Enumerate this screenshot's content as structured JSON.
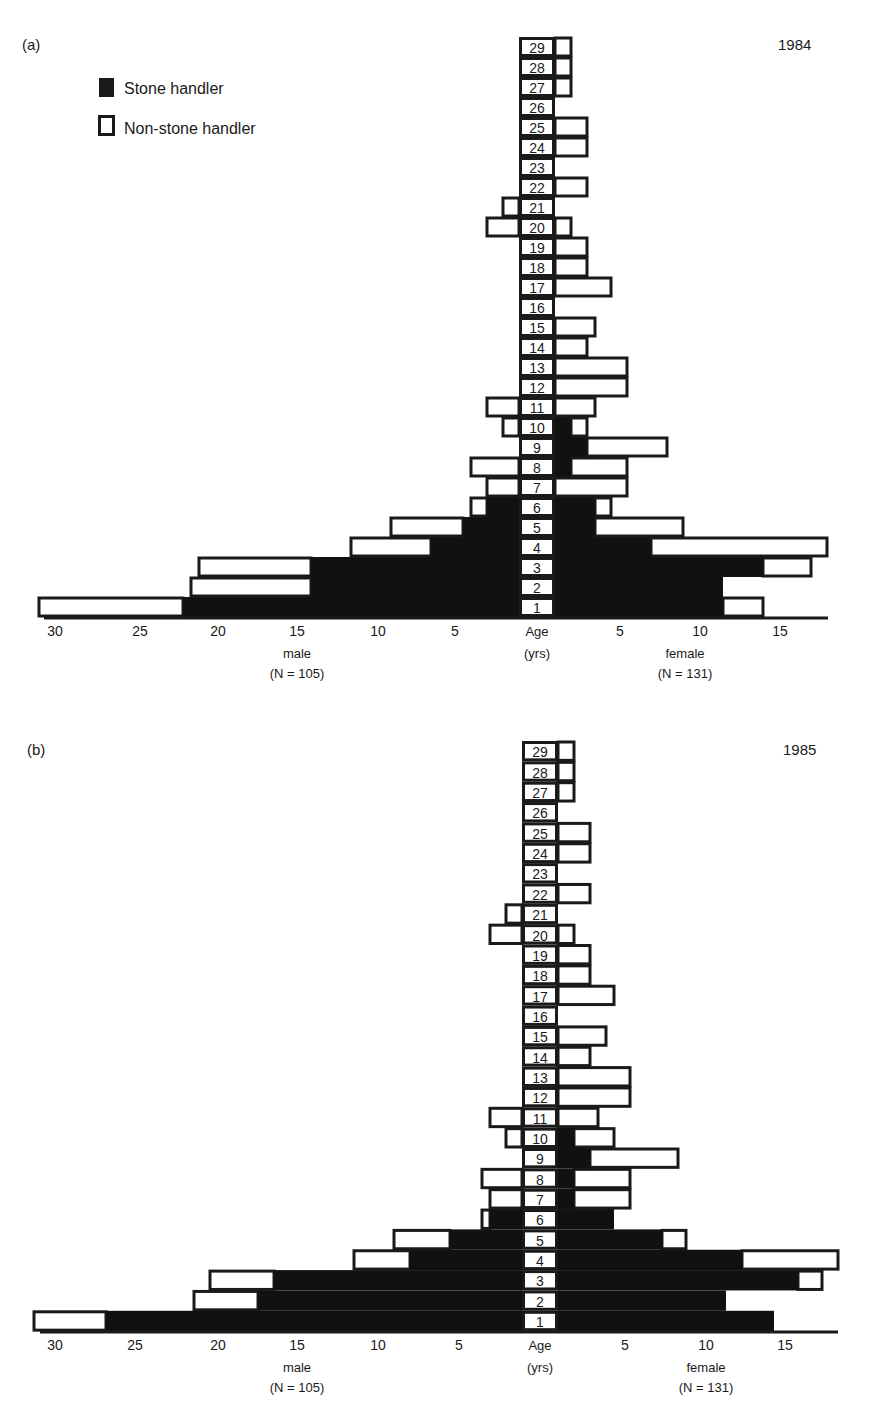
{
  "legend": {
    "stone_label": "Stone handler",
    "non_stone_label": "Non-stone handler"
  },
  "colors": {
    "stone": "#111111",
    "non_stone": "#ffffff",
    "stroke": "#1a1a1a"
  },
  "chart_data": [
    {
      "type": "bar",
      "subtype": "population-pyramid (stacked horizontal)",
      "panel": "(a)",
      "title": "1984",
      "ylabel": "Age (yrs)",
      "left_label": "male",
      "left_n": "(N = 105)",
      "right_label": "female",
      "right_n": "(N = 131)",
      "left_ticks": [
        30,
        25,
        20,
        15,
        10,
        5
      ],
      "right_ticks": [
        5,
        10,
        15
      ],
      "categories": [
        1,
        2,
        3,
        4,
        5,
        6,
        7,
        8,
        9,
        10,
        11,
        12,
        13,
        14,
        15,
        16,
        17,
        18,
        19,
        20,
        21,
        22,
        23,
        24,
        25,
        26,
        27,
        28,
        29
      ],
      "series": [
        {
          "name": "male stone handler",
          "values": [
            21,
            13,
            13,
            5.5,
            3.5,
            2,
            0,
            0,
            0,
            0,
            0,
            0,
            0,
            0,
            0,
            0,
            0,
            0,
            0,
            0,
            0,
            0,
            0,
            0,
            0,
            0,
            0,
            0,
            0
          ]
        },
        {
          "name": "male non-stone handler",
          "values": [
            9,
            7.5,
            7,
            5,
            4.5,
            1,
            2,
            3,
            0,
            1,
            2,
            0,
            0,
            0,
            0,
            0,
            0,
            0,
            0,
            2,
            1,
            0,
            0,
            0,
            0,
            0,
            0,
            0,
            0
          ]
        },
        {
          "name": "female stone handler",
          "values": [
            10.5,
            10.5,
            13,
            6,
            2.5,
            2.5,
            0,
            1,
            2,
            1,
            0,
            0,
            0,
            0,
            0,
            0,
            0,
            0,
            0,
            0,
            0,
            0,
            0,
            0,
            0,
            0,
            0,
            0,
            0
          ]
        },
        {
          "name": "female non-stone handler",
          "values": [
            2.5,
            0,
            3,
            11,
            5.5,
            1,
            4.5,
            3.5,
            5,
            1,
            2.5,
            4.5,
            4.5,
            2,
            2.5,
            0,
            3.5,
            2,
            2,
            1,
            0,
            2,
            0,
            2,
            2,
            0,
            1,
            1,
            1
          ]
        }
      ]
    },
    {
      "type": "bar",
      "subtype": "population-pyramid (stacked horizontal)",
      "panel": "(b)",
      "title": "1985",
      "ylabel": "Age (yrs)",
      "left_label": "male",
      "left_n": "(N = 105)",
      "right_label": "female",
      "right_n": "(N = 131)",
      "left_ticks": [
        30,
        25,
        20,
        15,
        10,
        5
      ],
      "right_ticks": [
        5,
        10,
        15
      ],
      "categories": [
        1,
        2,
        3,
        4,
        5,
        6,
        7,
        8,
        9,
        10,
        11,
        12,
        13,
        14,
        15,
        16,
        17,
        18,
        19,
        20,
        21,
        22,
        23,
        24,
        25,
        26,
        27,
        28,
        29
      ],
      "series": [
        {
          "name": "male stone handler",
          "values": [
            26,
            16.5,
            15.5,
            7,
            4.5,
            2,
            0,
            0,
            0,
            0,
            0,
            0,
            0,
            0,
            0,
            0,
            0,
            0,
            0,
            0,
            0,
            0,
            0,
            0,
            0,
            0,
            0,
            0,
            0
          ]
        },
        {
          "name": "male non-stone handler",
          "values": [
            4.5,
            4,
            4,
            3.5,
            3.5,
            0.5,
            2,
            2.5,
            0,
            1,
            2,
            0,
            0,
            0,
            0,
            0,
            0,
            0,
            0,
            2,
            1,
            0,
            0,
            0,
            0,
            0,
            0,
            0,
            0
          ]
        },
        {
          "name": "female stone handler",
          "values": [
            13.5,
            10.5,
            15,
            11.5,
            6.5,
            3.5,
            1,
            1,
            2,
            1,
            0,
            0,
            0,
            0,
            0,
            0,
            0,
            0,
            0,
            0,
            0,
            0,
            0,
            0,
            0,
            0,
            0,
            0,
            0
          ]
        },
        {
          "name": "female non-stone handler",
          "values": [
            0,
            0,
            1.5,
            6,
            1.5,
            0,
            3.5,
            3.5,
            5.5,
            2.5,
            2.5,
            4.5,
            4.5,
            2,
            3,
            0,
            3.5,
            2,
            2,
            1,
            0,
            2,
            0,
            2,
            2,
            0,
            1,
            1,
            1
          ]
        }
      ]
    }
  ],
  "layout": [
    {
      "col_left": 519,
      "col_right": 555,
      "row_top": 37,
      "row_h": 20,
      "px_per_unit": 16,
      "axis_y": 617,
      "axis_left": 44,
      "axis_right": 828,
      "label_y": 88,
      "year_x": 778,
      "year_y": 50,
      "panel_x": 22,
      "panel_y": 50,
      "tick_y": 636,
      "left_tick_x": [
        55,
        140,
        218,
        297,
        378,
        455
      ],
      "right_tick_x": [
        620,
        700,
        780
      ],
      "age_x": 537,
      "male_x": 297,
      "female_x": 685,
      "lbl1_y": 658,
      "lbl2_y": 678
    },
    {
      "col_left": 522,
      "col_right": 558,
      "row_top": 741,
      "row_h": 20.35,
      "px_per_unit": 16,
      "axis_y": 1331,
      "axis_left": 40,
      "axis_right": 838,
      "label_y": 0,
      "year_x": 783,
      "year_y": 755,
      "panel_x": 27,
      "panel_y": 755,
      "tick_y": 1350,
      "left_tick_x": [
        55,
        135,
        218,
        297,
        378,
        459
      ],
      "right_tick_x": [
        625,
        706,
        785
      ],
      "age_x": 540,
      "male_x": 297,
      "female_x": 706,
      "lbl1_y": 1372,
      "lbl2_y": 1392
    }
  ]
}
